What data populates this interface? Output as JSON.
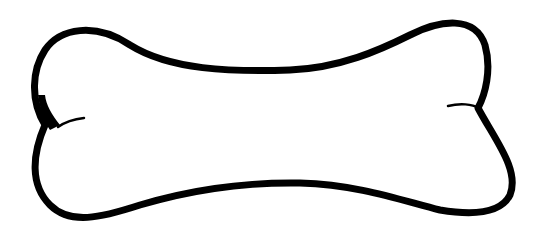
{
  "image": {
    "subject": "bone-outline",
    "stroke_color": "#000000",
    "background_color": "#ffffff"
  }
}
